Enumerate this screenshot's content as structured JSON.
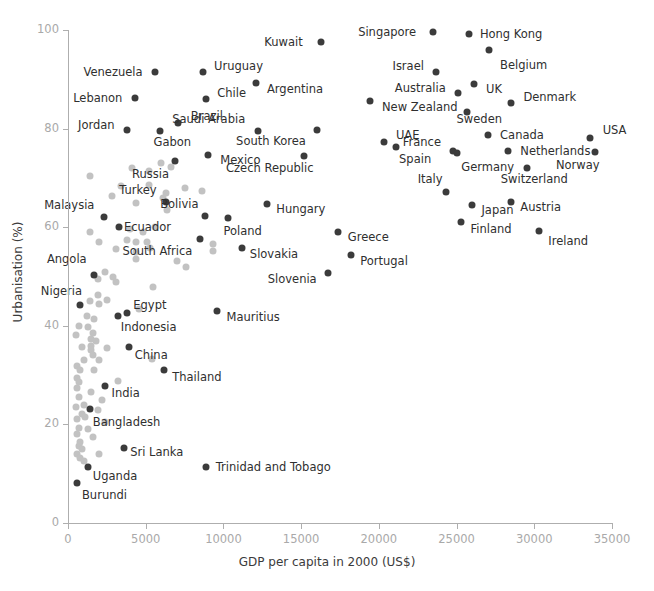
{
  "chart_data": {
    "type": "scatter",
    "title": "",
    "xlabel": "GDP per capita in 2000 (US$)",
    "ylabel": "Urbanisation (%)",
    "xlim": [
      0,
      35000
    ],
    "ylim": [
      0,
      100
    ],
    "xticks": [
      0,
      5000,
      10000,
      15000,
      20000,
      25000,
      30000,
      35000
    ],
    "xtick_labels": [
      "0",
      "5000",
      "10000",
      "15000",
      "20000",
      "25000",
      "30000",
      "35000"
    ],
    "yticks": [
      0,
      20,
      40,
      60,
      80,
      100
    ],
    "ytick_labels": [
      "0",
      "20",
      "40",
      "60",
      "80",
      "100"
    ],
    "grid": false,
    "legend": "none",
    "colors": {
      "highlight": "#3b3b3b",
      "faded": "#c2c2c2",
      "axis": "#aeaeae",
      "tick_text": "#a9a9a9",
      "label_text": "#2f2f2f"
    },
    "labeled_points": [
      {
        "label": "Kuwait",
        "x": 16300,
        "y": 97.6,
        "lx": 15100,
        "ly": 97.6,
        "anchor": "right"
      },
      {
        "label": "Singapore",
        "x": 23500,
        "y": 99.5,
        "lx": 22400,
        "ly": 99.5,
        "anchor": "right"
      },
      {
        "label": "Hong Kong",
        "x": 25800,
        "y": 99.2,
        "lx": 26500,
        "ly": 99.2,
        "anchor": "left"
      },
      {
        "label": "Belgium",
        "x": 27100,
        "y": 96.0,
        "lx": 27800,
        "ly": 93.0,
        "anchor": "left"
      },
      {
        "label": "Venezuela",
        "x": 5600,
        "y": 91.5,
        "lx": 4800,
        "ly": 91.5,
        "anchor": "right"
      },
      {
        "label": "Uruguay",
        "x": 8700,
        "y": 91.5,
        "lx": 9400,
        "ly": 92.6,
        "anchor": "left"
      },
      {
        "label": "Argentina",
        "x": 12100,
        "y": 89.3,
        "lx": 12800,
        "ly": 88.0,
        "anchor": "left"
      },
      {
        "label": "Israel",
        "x": 23700,
        "y": 91.4,
        "lx": 22900,
        "ly": 92.6,
        "anchor": "right"
      },
      {
        "label": "Lebanon",
        "x": 4300,
        "y": 86.3,
        "lx": 3500,
        "ly": 86.3,
        "anchor": "right"
      },
      {
        "label": "Chile",
        "x": 8900,
        "y": 86.0,
        "lx": 9600,
        "ly": 87.2,
        "anchor": "left"
      },
      {
        "label": "UK",
        "x": 26100,
        "y": 89.0,
        "lx": 26900,
        "ly": 88.0,
        "anchor": "left"
      },
      {
        "label": "Australia",
        "x": 25100,
        "y": 87.2,
        "lx": 24300,
        "ly": 88.2,
        "anchor": "right"
      },
      {
        "label": "Denmark",
        "x": 28500,
        "y": 85.1,
        "lx": 29300,
        "ly": 86.5,
        "anchor": "left"
      },
      {
        "label": "New Zealand",
        "x": 19400,
        "y": 85.5,
        "lx": 20200,
        "ly": 84.3,
        "anchor": "left"
      },
      {
        "label": "Jordan",
        "x": 3800,
        "y": 79.7,
        "lx": 3000,
        "ly": 80.8,
        "anchor": "right"
      },
      {
        "label": "Brazil",
        "x": 7100,
        "y": 81.1,
        "lx": 7900,
        "ly": 82.5,
        "anchor": "left"
      },
      {
        "label": "Gabon",
        "x": 5900,
        "y": 79.6,
        "lx": 5500,
        "ly": 77.2,
        "anchor": "left"
      },
      {
        "label": "Saudi Arabia",
        "x": 12200,
        "y": 79.6,
        "lx": 11400,
        "ly": 81.9,
        "anchor": "right"
      },
      {
        "label": "Sweden",
        "x": 25700,
        "y": 83.3,
        "lx": 25000,
        "ly": 82.0,
        "anchor": "left"
      },
      {
        "label": "South Korea",
        "x": 16000,
        "y": 79.7,
        "lx": 15300,
        "ly": 77.4,
        "anchor": "right"
      },
      {
        "label": "Canada",
        "x": 27000,
        "y": 78.7,
        "lx": 27800,
        "ly": 78.7,
        "anchor": "left"
      },
      {
        "label": "USA",
        "x": 33600,
        "y": 78.1,
        "lx": 34400,
        "ly": 79.7,
        "anchor": "left"
      },
      {
        "label": "UAE",
        "x": 20300,
        "y": 77.3,
        "lx": 21100,
        "ly": 78.8,
        "anchor": "left"
      },
      {
        "label": "France",
        "x": 24800,
        "y": 75.5,
        "lx": 24000,
        "ly": 77.2,
        "anchor": "right"
      },
      {
        "label": "Netherlands",
        "x": 28300,
        "y": 75.5,
        "lx": 29100,
        "ly": 75.5,
        "anchor": "left"
      },
      {
        "label": "Spain",
        "x": 21100,
        "y": 76.2,
        "lx": 21300,
        "ly": 73.8,
        "anchor": "left"
      },
      {
        "label": "Norway",
        "x": 33900,
        "y": 75.2,
        "lx": 34200,
        "ly": 72.6,
        "anchor": "right"
      },
      {
        "label": "Mexico",
        "x": 9000,
        "y": 74.7,
        "lx": 9800,
        "ly": 73.6,
        "anchor": "left"
      },
      {
        "label": "Czech Republic",
        "x": 15200,
        "y": 74.5,
        "lx": 15800,
        "ly": 72.0,
        "anchor": "right"
      },
      {
        "label": "Germany",
        "x": 25000,
        "y": 75.0,
        "lx": 25300,
        "ly": 72.3,
        "anchor": "left"
      },
      {
        "label": "Switzerland",
        "x": 29500,
        "y": 72.0,
        "lx": 30000,
        "ly": 69.8,
        "anchor": "center"
      },
      {
        "label": "Russia",
        "x": 6900,
        "y": 73.4,
        "lx": 6500,
        "ly": 70.8,
        "anchor": "right"
      },
      {
        "label": "Italy",
        "x": 24300,
        "y": 67.2,
        "lx": 24100,
        "ly": 69.8,
        "anchor": "right"
      },
      {
        "label": "Turkey",
        "x": 6300,
        "y": 65.1,
        "lx": 5700,
        "ly": 67.6,
        "anchor": "right"
      },
      {
        "label": "Hungary",
        "x": 12800,
        "y": 64.8,
        "lx": 13400,
        "ly": 63.6,
        "anchor": "left"
      },
      {
        "label": "Japan",
        "x": 26000,
        "y": 64.6,
        "lx": 26600,
        "ly": 63.4,
        "anchor": "left"
      },
      {
        "label": "Austria",
        "x": 28500,
        "y": 65.2,
        "lx": 29100,
        "ly": 64.0,
        "anchor": "left"
      },
      {
        "label": "Malaysia",
        "x": 2300,
        "y": 62.0,
        "lx": 1700,
        "ly": 64.5,
        "anchor": "right"
      },
      {
        "label": "Bolivia",
        "x": 8800,
        "y": 62.2,
        "lx": 8400,
        "ly": 64.8,
        "anchor": "right"
      },
      {
        "label": "Poland",
        "x": 10300,
        "y": 61.8,
        "lx": 10000,
        "ly": 59.3,
        "anchor": "left"
      },
      {
        "label": "Ecuador",
        "x": 3300,
        "y": 60.0,
        "lx": 3600,
        "ly": 60.0,
        "anchor": "left"
      },
      {
        "label": "Finland",
        "x": 25300,
        "y": 61.0,
        "lx": 25900,
        "ly": 59.7,
        "anchor": "left"
      },
      {
        "label": "Ireland",
        "x": 30300,
        "y": 59.2,
        "lx": 30900,
        "ly": 57.3,
        "anchor": "left"
      },
      {
        "label": "Greece",
        "x": 17400,
        "y": 59.0,
        "lx": 18000,
        "ly": 58.0,
        "anchor": "left"
      },
      {
        "label": "South Africa",
        "x": 8500,
        "y": 57.6,
        "lx": 8000,
        "ly": 55.1,
        "anchor": "right"
      },
      {
        "label": "Slovakia",
        "x": 11200,
        "y": 55.8,
        "lx": 11700,
        "ly": 54.5,
        "anchor": "left"
      },
      {
        "label": "Portugal",
        "x": 18200,
        "y": 54.4,
        "lx": 18800,
        "ly": 53.1,
        "anchor": "left"
      },
      {
        "label": "Slovenia",
        "x": 16700,
        "y": 50.8,
        "lx": 16000,
        "ly": 49.5,
        "anchor": "right"
      },
      {
        "label": "Angola",
        "x": 1700,
        "y": 50.4,
        "lx": 1200,
        "ly": 53.5,
        "anchor": "right"
      },
      {
        "label": "Nigeria",
        "x": 800,
        "y": 44.3,
        "lx": 900,
        "ly": 47.0,
        "anchor": "right"
      },
      {
        "label": "Egypt",
        "x": 3800,
        "y": 42.6,
        "lx": 4200,
        "ly": 44.3,
        "anchor": "left"
      },
      {
        "label": "Mauritius",
        "x": 9600,
        "y": 43.0,
        "lx": 10200,
        "ly": 41.8,
        "anchor": "left"
      },
      {
        "label": "Indonesia",
        "x": 3200,
        "y": 42.0,
        "lx": 3400,
        "ly": 39.7,
        "anchor": "left"
      },
      {
        "label": "China",
        "x": 3900,
        "y": 35.8,
        "lx": 4300,
        "ly": 34.0,
        "anchor": "left"
      },
      {
        "label": "Thailand",
        "x": 6200,
        "y": 31.1,
        "lx": 6700,
        "ly": 29.7,
        "anchor": "left"
      },
      {
        "label": "India",
        "x": 2400,
        "y": 27.7,
        "lx": 2800,
        "ly": 26.4,
        "anchor": "left"
      },
      {
        "label": "Bangladesh",
        "x": 1400,
        "y": 23.2,
        "lx": 1600,
        "ly": 20.5,
        "anchor": "left"
      },
      {
        "label": "Sri Lanka",
        "x": 3600,
        "y": 15.2,
        "lx": 4000,
        "ly": 14.5,
        "anchor": "left"
      },
      {
        "label": "Uganda",
        "x": 1300,
        "y": 11.4,
        "lx": 1600,
        "ly": 9.5,
        "anchor": "left"
      },
      {
        "label": "Burundi",
        "x": 600,
        "y": 8.2,
        "lx": 900,
        "ly": 5.6,
        "anchor": "left"
      },
      {
        "label": "Trinidad and Tobago",
        "x": 8900,
        "y": 11.3,
        "lx": 9500,
        "ly": 11.3,
        "anchor": "left"
      }
    ],
    "unlabeled_points": [
      {
        "x": 1400,
        "y": 70.3
      },
      {
        "x": 4100,
        "y": 72.0
      },
      {
        "x": 5200,
        "y": 71.5
      },
      {
        "x": 6000,
        "y": 73.0
      },
      {
        "x": 6600,
        "y": 72.2
      },
      {
        "x": 3400,
        "y": 68.3
      },
      {
        "x": 5200,
        "y": 68.5
      },
      {
        "x": 7500,
        "y": 68.0
      },
      {
        "x": 8600,
        "y": 67.3
      },
      {
        "x": 2800,
        "y": 66.4
      },
      {
        "x": 6100,
        "y": 66.0
      },
      {
        "x": 6300,
        "y": 67.0
      },
      {
        "x": 6400,
        "y": 63.5
      },
      {
        "x": 4400,
        "y": 65.0
      },
      {
        "x": 1400,
        "y": 59.0
      },
      {
        "x": 4000,
        "y": 59.6
      },
      {
        "x": 4800,
        "y": 59.0
      },
      {
        "x": 5600,
        "y": 60.0
      },
      {
        "x": 2000,
        "y": 57.0
      },
      {
        "x": 3800,
        "y": 57.5
      },
      {
        "x": 4400,
        "y": 57.0
      },
      {
        "x": 5100,
        "y": 57.0
      },
      {
        "x": 3100,
        "y": 55.5
      },
      {
        "x": 4400,
        "y": 55.0
      },
      {
        "x": 4400,
        "y": 53.6
      },
      {
        "x": 5300,
        "y": 55.7
      },
      {
        "x": 9300,
        "y": 56.5
      },
      {
        "x": 9300,
        "y": 55.2
      },
      {
        "x": 7000,
        "y": 53.2
      },
      {
        "x": 7600,
        "y": 52.0
      },
      {
        "x": 2400,
        "y": 50.9
      },
      {
        "x": 2900,
        "y": 50.0
      },
      {
        "x": 1900,
        "y": 49.5
      },
      {
        "x": 3100,
        "y": 48.8
      },
      {
        "x": 5500,
        "y": 47.8
      },
      {
        "x": 1900,
        "y": 46.3
      },
      {
        "x": 2500,
        "y": 45.2
      },
      {
        "x": 1400,
        "y": 45.0
      },
      {
        "x": 2000,
        "y": 44.4
      },
      {
        "x": 4600,
        "y": 43.5
      },
      {
        "x": 1200,
        "y": 42.0
      },
      {
        "x": 1700,
        "y": 41.3
      },
      {
        "x": 700,
        "y": 40.0
      },
      {
        "x": 1300,
        "y": 39.7
      },
      {
        "x": 1600,
        "y": 38.6
      },
      {
        "x": 500,
        "y": 38.2
      },
      {
        "x": 1500,
        "y": 37.4
      },
      {
        "x": 1800,
        "y": 37.0
      },
      {
        "x": 1500,
        "y": 36.0
      },
      {
        "x": 900,
        "y": 35.6
      },
      {
        "x": 1500,
        "y": 35.1
      },
      {
        "x": 2500,
        "y": 35.4
      },
      {
        "x": 1600,
        "y": 34.0
      },
      {
        "x": 1000,
        "y": 33.0
      },
      {
        "x": 2000,
        "y": 33.0
      },
      {
        "x": 5400,
        "y": 33.3
      },
      {
        "x": 600,
        "y": 31.8
      },
      {
        "x": 800,
        "y": 31.0
      },
      {
        "x": 1700,
        "y": 31.0
      },
      {
        "x": 600,
        "y": 29.5
      },
      {
        "x": 700,
        "y": 28.5
      },
      {
        "x": 3200,
        "y": 28.8
      },
      {
        "x": 600,
        "y": 27.3
      },
      {
        "x": 1500,
        "y": 26.6
      },
      {
        "x": 700,
        "y": 25.5
      },
      {
        "x": 2200,
        "y": 25.0
      },
      {
        "x": 500,
        "y": 23.6
      },
      {
        "x": 1000,
        "y": 24.0
      },
      {
        "x": 1900,
        "y": 23.0
      },
      {
        "x": 900,
        "y": 22.2
      },
      {
        "x": 600,
        "y": 21.0
      },
      {
        "x": 1100,
        "y": 21.5
      },
      {
        "x": 2400,
        "y": 20.5
      },
      {
        "x": 700,
        "y": 19.3
      },
      {
        "x": 1300,
        "y": 19.0
      },
      {
        "x": 600,
        "y": 18.1
      },
      {
        "x": 1600,
        "y": 17.5
      },
      {
        "x": 800,
        "y": 16.5
      },
      {
        "x": 700,
        "y": 15.6
      },
      {
        "x": 900,
        "y": 15.0
      },
      {
        "x": 2000,
        "y": 13.9
      },
      {
        "x": 600,
        "y": 14.0
      },
      {
        "x": 800,
        "y": 13.2
      },
      {
        "x": 1000,
        "y": 12.6
      }
    ]
  }
}
